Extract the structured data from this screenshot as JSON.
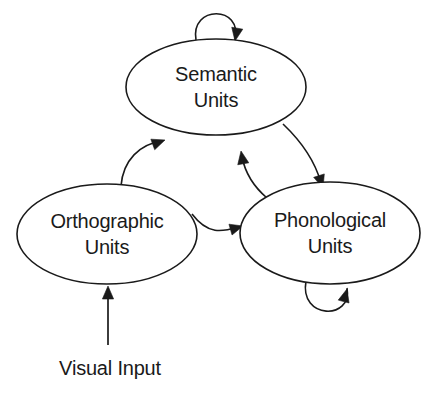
{
  "figure": {
    "type": "diagram",
    "subtype": "node-and-arrow network diagram",
    "background_color": "#ffffff",
    "stroke_color": "#1a1a1a",
    "text_color": "#1a1a1a",
    "width": 431,
    "height": 394
  },
  "nodes": [
    {
      "id": "semantic",
      "label_line1": "Semantic",
      "label_line2": "Units",
      "shape": "ellipse",
      "cx": 216,
      "cy": 87,
      "rx": 90,
      "ry": 48
    },
    {
      "id": "orthographic",
      "label_line1": "Orthographic",
      "label_line2": "Units",
      "shape": "ellipse",
      "cx": 107,
      "cy": 234,
      "rx": 90,
      "ry": 50
    },
    {
      "id": "phonological",
      "label_line1": "Phonological",
      "label_line2": "Units",
      "shape": "ellipse",
      "cx": 330,
      "cy": 233,
      "rx": 90,
      "ry": 51
    }
  ],
  "edges": [
    {
      "id": "semantic-self",
      "from": "semantic",
      "to": "semantic",
      "kind": "self-loop",
      "position": "top",
      "arrow": "single",
      "path": "M 196 40 C 190 5 243 5 235 40",
      "arrow_x": 235,
      "arrow_y": 41,
      "arrow_angle": 100
    },
    {
      "id": "phonological-self",
      "from": "phonological",
      "to": "phonological",
      "kind": "self-loop",
      "position": "bottom",
      "arrow": "single",
      "path": "M 306 281 C 299 320 353 320 347 288",
      "arrow_x": 347,
      "arrow_y": 289,
      "arrow_angle": -75
    },
    {
      "id": "orthographic-to-semantic",
      "from": "orthographic",
      "to": "semantic",
      "kind": "curve",
      "arrow": "single",
      "path": "M 121 186 C 123 160 140 144 162 141",
      "arrow_x": 165,
      "arrow_y": 140,
      "arrow_angle": -20
    },
    {
      "id": "orthographic-to-phonological",
      "from": "orthographic",
      "to": "phonological",
      "kind": "curve",
      "arrow": "single",
      "path": "M 192 214 C 208 235 222 232 238 227",
      "arrow_x": 243,
      "arrow_y": 226,
      "arrow_angle": -16
    },
    {
      "id": "semantic-to-phonological",
      "from": "semantic",
      "to": "phonological",
      "kind": "curve",
      "arrow": "single",
      "path": "M 283 124 C 303 143 315 161 321 183",
      "arrow_x": 323,
      "arrow_y": 188,
      "arrow_angle": 72
    },
    {
      "id": "phonological-to-semantic",
      "from": "phonological",
      "to": "semantic",
      "kind": "curve",
      "arrow": "single",
      "path": "M 267 198 C 253 186 245 172 242 157",
      "arrow_x": 241,
      "arrow_y": 151,
      "arrow_angle": -100
    },
    {
      "id": "visual-input-to-orthographic",
      "from": "visual-input",
      "to": "orthographic",
      "kind": "straight",
      "arrow": "single",
      "path": "M 108 345 L 108 296",
      "arrow_x": 108,
      "arrow_y": 286,
      "arrow_angle": -90
    }
  ],
  "labels": [
    {
      "id": "visual-input",
      "text": "Visual Input",
      "x": 110,
      "y": 375
    }
  ]
}
